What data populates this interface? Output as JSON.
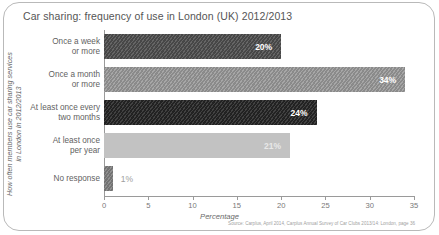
{
  "chart_data": {
    "type": "bar",
    "orientation": "horizontal",
    "title": "Car sharing: frequency of use in London (UK) 2012/2013",
    "xlabel": "Percentage",
    "ylabel": "How often members use car sharing services\nin London in 2012/2013",
    "xlim": [
      0,
      35
    ],
    "xticks": [
      0,
      5,
      10,
      15,
      20,
      25,
      30,
      35
    ],
    "grid": false,
    "legend": "none",
    "categories": [
      "Once a week\nor more",
      "Once a month\nor more",
      "At least once every\ntwo months",
      "At least once\nper year",
      "No response"
    ],
    "values": [
      20,
      34,
      24,
      21,
      1
    ],
    "value_labels": [
      "20%",
      "34%",
      "24%",
      "21%",
      "1%"
    ],
    "bar_colors": [
      "#4f4f4f",
      "#9a9a9a",
      "#262626",
      "#c2c2c2",
      "#808080"
    ],
    "label_colors": [
      "#ffffff",
      "#ffffff",
      "#ffffff",
      "#e8e8e8",
      "#9e9e9e"
    ],
    "bar_hatched": [
      true,
      true,
      true,
      false,
      true
    ],
    "label_inside": [
      true,
      true,
      true,
      true,
      false
    ],
    "source": "Source: Carplus, April 2014, Carplus Annual Survey of Car Clubs 2013/14: London, page 36"
  }
}
